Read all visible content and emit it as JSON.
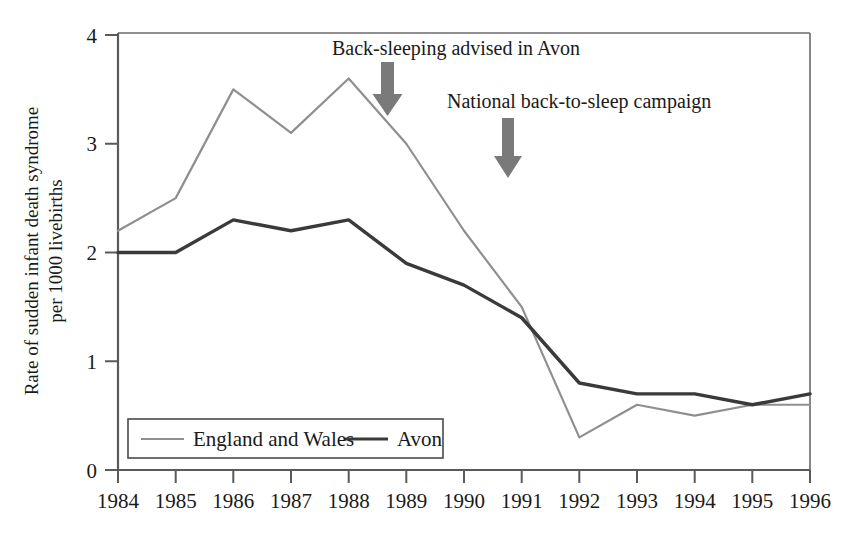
{
  "chart_data": {
    "type": "line",
    "title": "",
    "xlabel": "",
    "ylabel": "Rate of sudden infant death syndrome per 1000 livebirths",
    "ylabel_line1": "Rate of sudden infant death syndrome",
    "ylabel_line2": "per 1000 livebirths",
    "x": [
      1984,
      1985,
      1986,
      1987,
      1988,
      1989,
      1990,
      1991,
      1992,
      1993,
      1994,
      1995,
      1996
    ],
    "categories": [
      "1984",
      "1985",
      "1986",
      "1987",
      "1988",
      "1989",
      "1990",
      "1991",
      "1992",
      "1993",
      "1994",
      "1995",
      "1996"
    ],
    "xlim": [
      1984,
      1996
    ],
    "ylim": [
      0,
      4
    ],
    "yticks": [
      0,
      1,
      2,
      3,
      4
    ],
    "yticklabels": [
      "0",
      "1",
      "2",
      "3",
      "4"
    ],
    "grid": false,
    "legend_position": "bottom-left",
    "series": [
      {
        "name": "England and Wales",
        "color": "#8f8f8f",
        "values": [
          2.2,
          2.5,
          3.5,
          3.1,
          3.6,
          3.0,
          2.2,
          1.5,
          0.3,
          0.6,
          0.5,
          0.6,
          0.6
        ]
      },
      {
        "name": "Avon",
        "color": "#3a3a3a",
        "values": [
          2.0,
          2.0,
          2.3,
          2.2,
          2.3,
          1.9,
          1.7,
          1.4,
          0.8,
          0.7,
          0.7,
          0.6,
          0.7
        ]
      }
    ],
    "annotations": [
      {
        "id": "back-sleeping-avon",
        "text": "Back-sleeping advised in Avon",
        "arrow_x": 1988.8,
        "arrow_top_value": 3.95,
        "arrow_bottom_value": 3.42
      },
      {
        "id": "national-campaign",
        "text": "National back-to-sleep campaign",
        "arrow_x": 1990.9,
        "arrow_top_value": 3.4,
        "arrow_bottom_value": 2.8
      }
    ]
  },
  "legend": {
    "items": [
      {
        "label": "England and Wales",
        "color": "#8f8f8f",
        "style": "thin"
      },
      {
        "label": "Avon",
        "color": "#3a3a3a",
        "style": "thick"
      }
    ]
  },
  "colors": {
    "axis": "#4a4a4a",
    "text": "#1a1a1a",
    "england_wales": "#8f8f8f",
    "avon": "#3a3a3a",
    "arrow": "#6e6e6e",
    "legend_border": "#4a4a4a",
    "background": "#ffffff"
  }
}
